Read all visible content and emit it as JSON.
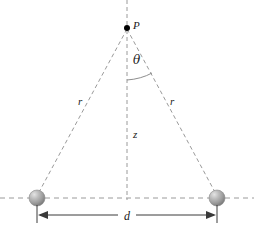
{
  "figure": {
    "name": "two-point-charges-on-axis-geometry",
    "background_color": "#ffffff",
    "width": 254,
    "height": 230,
    "labels": {
      "point_p": "P",
      "radius_left": "r",
      "radius_right": "r",
      "height_z": "z",
      "angle_theta": "θ",
      "separation_d": "d"
    },
    "colors": {
      "dashed_line": "#9a9a9a",
      "solid_line": "#3a3a3a",
      "sphere_fill": "#9e9e9e",
      "sphere_highlight": "#d9d9d9",
      "sphere_edge": "#6e6e6e",
      "text": "#1a1a1a",
      "point_marker": "#000000"
    },
    "geometry": {
      "apex_point": [
        127,
        28
      ],
      "sphere_left": [
        37,
        198
      ],
      "sphere_right": [
        217,
        198
      ],
      "sphere_radius": 8,
      "baseline_y": 198,
      "vertical_axis_x": 127,
      "dimension_line_y": 215,
      "arc_center": [
        127,
        28
      ],
      "arc_radius": 52
    },
    "elements": [
      {
        "name": "vertical-dashed-axis",
        "type": "dashed-line"
      },
      {
        "name": "horizontal-dashed-baseline",
        "type": "dashed-line"
      },
      {
        "name": "left-radius-dashed-leg",
        "type": "dashed-line"
      },
      {
        "name": "right-radius-dashed-leg",
        "type": "dashed-line"
      },
      {
        "name": "theta-arc",
        "type": "arc"
      },
      {
        "name": "dimension-line-d",
        "type": "double-arrow"
      },
      {
        "name": "sphere-left",
        "type": "sphere"
      },
      {
        "name": "sphere-right",
        "type": "sphere"
      },
      {
        "name": "point-p-marker",
        "type": "dot"
      }
    ]
  }
}
